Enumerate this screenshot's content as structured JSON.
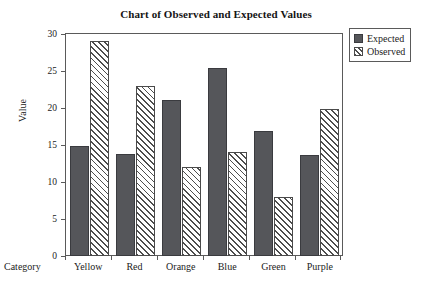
{
  "chart_data": {
    "type": "bar",
    "title": "Chart of Observed and Expected Values",
    "xlabel": "Category",
    "ylabel": "Value",
    "categories": [
      "Yellow",
      "Red",
      "Orange",
      "Blue",
      "Green",
      "Purple"
    ],
    "series": [
      {
        "name": "Expected",
        "values": [
          14.9,
          13.8,
          21.1,
          25.4,
          16.9,
          13.7
        ],
        "fill": "solid",
        "color": "#55565a"
      },
      {
        "name": "Observed",
        "values": [
          29.0,
          23.0,
          12.0,
          14.0,
          8.0,
          19.9
        ],
        "fill": "diagonal-hatch",
        "color": "#ffffff"
      }
    ],
    "ylim": [
      0,
      30
    ],
    "yticks": [
      0,
      5,
      10,
      15,
      20,
      25,
      30
    ],
    "ytick_labels": [
      "0",
      "5",
      "10",
      "15",
      "20",
      "25",
      "30"
    ],
    "grid": false,
    "legend_position": "outside-top-right",
    "legend_entries": [
      "Expected",
      "Observed"
    ]
  },
  "legend": {
    "expected_label": "Expected",
    "observed_label": "Observed"
  },
  "axes": {
    "y_title": "Value",
    "x_title": "Category"
  }
}
